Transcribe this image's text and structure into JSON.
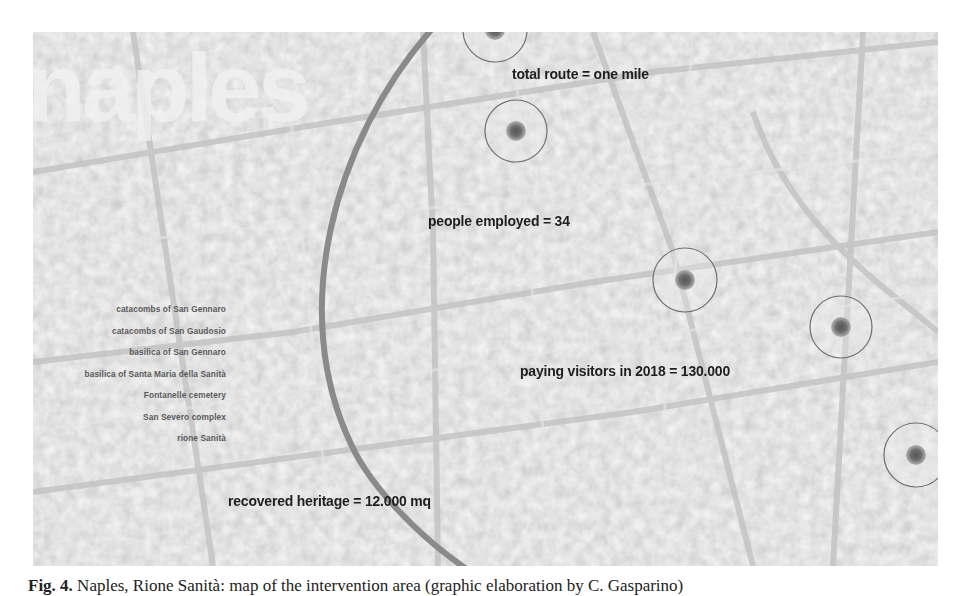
{
  "map": {
    "title": "naples",
    "stats": {
      "total_route": "total route = one mile",
      "people_employed": "people employed = 34",
      "paying_visitors": "paying visitors in 2018 = 130.000",
      "recovered_heritage": "recovered heritage = 12.000 mq"
    },
    "sites": [
      "catacombs of San Gennaro",
      "catacombs of San Gaudosio",
      "basilica of San Gennaro",
      "basilica of Santa Maria della Sanità",
      "Fontanelle cemetery",
      "San Severo complex",
      "rione Sanità"
    ],
    "markers": [
      {
        "x": 462,
        "y": -2
      },
      {
        "x": 483,
        "y": 99
      },
      {
        "x": 652,
        "y": 248
      },
      {
        "x": 808,
        "y": 295
      },
      {
        "x": 883,
        "y": 423
      }
    ],
    "colors": {
      "background": "#d4d4d4",
      "route_arc": "#8a8a8a",
      "marker_ring": "#6e6e6e",
      "marker_dot": "#6a6a6a",
      "label_text": "#1e1e1e",
      "site_text": "#5a5a5a"
    }
  },
  "caption": {
    "label": "Fig. 4.",
    "text": " Naples, Rione Sanità: map of the intervention area (graphic elaboration by C. Gasparino)"
  }
}
